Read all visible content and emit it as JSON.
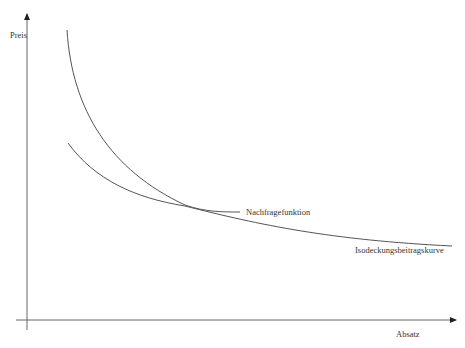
{
  "diagram": {
    "type": "economics-curve-diagram",
    "axes": {
      "y_label": "Preis",
      "x_label": "Absatz"
    },
    "curves": [
      {
        "id": "demand",
        "label": "Nachfragefunktion",
        "color": "#555555",
        "shape": "steep convex decreasing"
      },
      {
        "id": "iso-contribution",
        "label": "Isodeckungsbeitragskurve",
        "color": "#555555",
        "shape": "flatter convex decreasing (hyperbola)"
      }
    ],
    "intersection": "curves touch/cross near the middle of the chart"
  },
  "colors": {
    "axis": "#555555",
    "curve": "#555555",
    "text": "#333333",
    "background": "#ffffff"
  }
}
